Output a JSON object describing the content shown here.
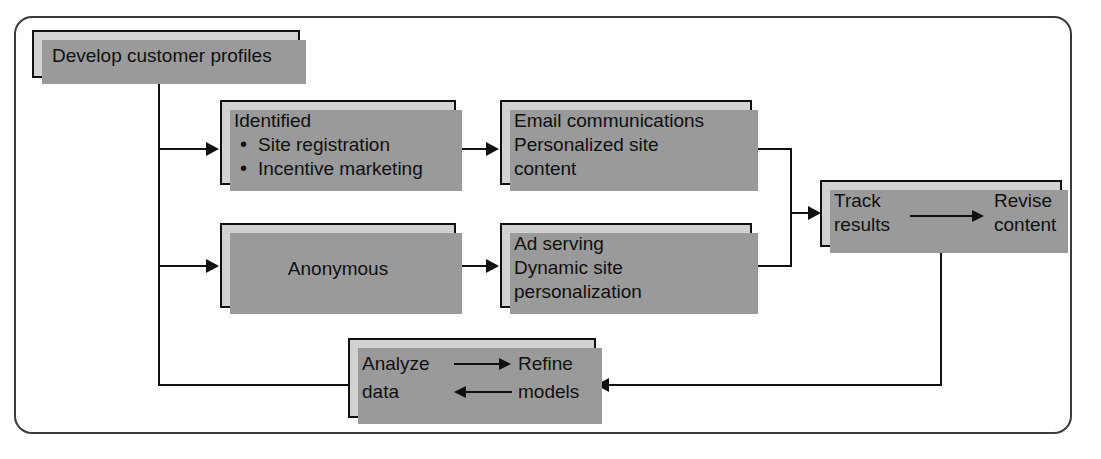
{
  "diagram": {
    "colors": {
      "node_fill": "#d2d2d2",
      "node_border": "#111111",
      "node_shadow": "#9a9a9a",
      "frame_border": "#3a3a3a",
      "line": "#111111",
      "background": "#ffffff"
    },
    "nodes": [
      {
        "id": "develop",
        "label": "Develop customer profiles",
        "lines": [
          "Develop customer profiles"
        ]
      },
      {
        "id": "identified",
        "heading": "Identified",
        "bullets": [
          "Site registration",
          "Incentive marketing"
        ]
      },
      {
        "id": "anonymous",
        "label": "Anonymous",
        "lines": [
          "Anonymous"
        ]
      },
      {
        "id": "email",
        "lines": [
          "Email communications",
          "Personalized site",
          "content"
        ]
      },
      {
        "id": "adserving",
        "lines": [
          "Ad serving",
          "Dynamic site",
          "personalization"
        ]
      },
      {
        "id": "track",
        "left_lines": [
          "Track",
          "results"
        ],
        "right_lines": [
          "Revise",
          "content"
        ],
        "inner_arrow": "arrow-right"
      },
      {
        "id": "analyze",
        "left_lines": [
          "Analyze",
          "data"
        ],
        "right_lines": [
          "Refine",
          "models"
        ],
        "inner_arrows": [
          "arrow-right",
          "arrow-left"
        ]
      }
    ],
    "edges": [
      {
        "from": "develop",
        "to": "identified",
        "type": "branch-down-right"
      },
      {
        "from": "develop",
        "to": "anonymous",
        "type": "branch-down-right"
      },
      {
        "from": "develop",
        "to": "analyze",
        "type": "branch-down-around"
      },
      {
        "from": "identified",
        "to": "email",
        "type": "straight-right"
      },
      {
        "from": "anonymous",
        "to": "adserving",
        "type": "straight-right"
      },
      {
        "from": "email",
        "to": "track",
        "type": "merge-right"
      },
      {
        "from": "adserving",
        "to": "track",
        "type": "merge-right"
      },
      {
        "from": "track",
        "to": "analyze",
        "type": "feedback-down-left"
      }
    ]
  }
}
